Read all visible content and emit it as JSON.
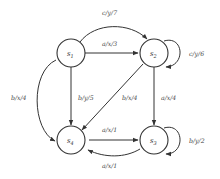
{
  "diagram": {
    "type": "state-machine",
    "states": [
      {
        "id": "s1",
        "label": "s",
        "sub": "1"
      },
      {
        "id": "s2",
        "label": "s",
        "sub": "2"
      },
      {
        "id": "s3",
        "label": "s",
        "sub": "3"
      },
      {
        "id": "s4",
        "label": "s",
        "sub": "4"
      }
    ],
    "transitions": [
      {
        "from": "s1",
        "to": "s2",
        "label": "c/y/7"
      },
      {
        "from": "s1",
        "to": "s2",
        "label": "a/x/3"
      },
      {
        "from": "s2",
        "to": "s2",
        "label": "c/y/6"
      },
      {
        "from": "s1",
        "to": "s4",
        "label": "b/x/4"
      },
      {
        "from": "s1",
        "to": "s4",
        "label": "b/y/5"
      },
      {
        "from": "s2",
        "to": "s4",
        "label": "b/x/4"
      },
      {
        "from": "s2",
        "to": "s3",
        "label": "a/x/4"
      },
      {
        "from": "s4",
        "to": "s3",
        "label": "a/x/1"
      },
      {
        "from": "s3",
        "to": "s4",
        "label": "a/x/1"
      },
      {
        "from": "s3",
        "to": "s3",
        "label": "b/y/2"
      }
    ]
  }
}
